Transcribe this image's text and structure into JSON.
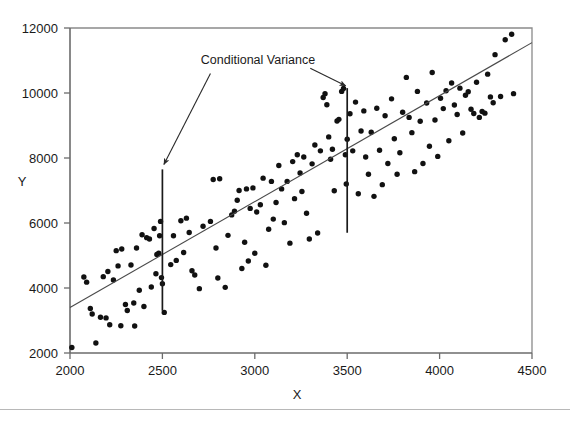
{
  "chart_data": {
    "type": "scatter",
    "title": "",
    "xlabel": "X",
    "ylabel": "Y",
    "xlim": [
      2000,
      4500
    ],
    "ylim": [
      2000,
      12000
    ],
    "xticks": [
      2000,
      2500,
      3000,
      3500,
      4000,
      4500
    ],
    "yticks": [
      2000,
      4000,
      6000,
      8000,
      10000,
      12000
    ],
    "xtick_labels": [
      "2000",
      "2500",
      "3000",
      "3500",
      "4000",
      "4500"
    ],
    "ytick_labels": [
      "2000",
      "4000",
      "6000",
      "8000",
      "10000",
      "12000"
    ],
    "grid": false,
    "legend": null,
    "series": [
      {
        "name": "observations",
        "marker": "filled-circle",
        "color": "#111111",
        "points": [
          [
            2010,
            2170
          ],
          [
            2075,
            4340
          ],
          [
            2090,
            4180
          ],
          [
            2110,
            3370
          ],
          [
            2120,
            3200
          ],
          [
            2140,
            2310
          ],
          [
            2165,
            3100
          ],
          [
            2180,
            4350
          ],
          [
            2195,
            3080
          ],
          [
            2205,
            4510
          ],
          [
            2215,
            2870
          ],
          [
            2235,
            4250
          ],
          [
            2250,
            5150
          ],
          [
            2260,
            4680
          ],
          [
            2275,
            2840
          ],
          [
            2280,
            5200
          ],
          [
            2300,
            3490
          ],
          [
            2310,
            3310
          ],
          [
            2330,
            4710
          ],
          [
            2345,
            3540
          ],
          [
            2350,
            2830
          ],
          [
            2360,
            5230
          ],
          [
            2375,
            3930
          ],
          [
            2390,
            5640
          ],
          [
            2400,
            3430
          ],
          [
            2415,
            5550
          ],
          [
            2430,
            5510
          ],
          [
            2440,
            4030
          ],
          [
            2455,
            5830
          ],
          [
            2465,
            4440
          ],
          [
            2470,
            5030
          ],
          [
            2480,
            5070
          ],
          [
            2485,
            5610
          ],
          [
            2490,
            6050
          ],
          [
            2495,
            4320
          ],
          [
            2500,
            4130
          ],
          [
            2510,
            3250
          ],
          [
            2545,
            4720
          ],
          [
            2560,
            5610
          ],
          [
            2575,
            4850
          ],
          [
            2600,
            6070
          ],
          [
            2615,
            5090
          ],
          [
            2630,
            6150
          ],
          [
            2645,
            5710
          ],
          [
            2660,
            4530
          ],
          [
            2675,
            4400
          ],
          [
            2700,
            3980
          ],
          [
            2720,
            5900
          ],
          [
            2760,
            6050
          ],
          [
            2775,
            7340
          ],
          [
            2790,
            5230
          ],
          [
            2800,
            4310
          ],
          [
            2810,
            7360
          ],
          [
            2840,
            4020
          ],
          [
            2855,
            5620
          ],
          [
            2875,
            6250
          ],
          [
            2890,
            6360
          ],
          [
            2905,
            6700
          ],
          [
            2915,
            7000
          ],
          [
            2930,
            4600
          ],
          [
            2945,
            5410
          ],
          [
            2955,
            7050
          ],
          [
            2965,
            4830
          ],
          [
            2975,
            6450
          ],
          [
            2990,
            7080
          ],
          [
            3000,
            5070
          ],
          [
            3010,
            6340
          ],
          [
            3030,
            6560
          ],
          [
            3045,
            7380
          ],
          [
            3060,
            4700
          ],
          [
            3075,
            5810
          ],
          [
            3090,
            7280
          ],
          [
            3100,
            6120
          ],
          [
            3115,
            6630
          ],
          [
            3130,
            7770
          ],
          [
            3145,
            7050
          ],
          [
            3160,
            6010
          ],
          [
            3175,
            7280
          ],
          [
            3190,
            5380
          ],
          [
            3205,
            7890
          ],
          [
            3215,
            6750
          ],
          [
            3230,
            8100
          ],
          [
            3245,
            7540
          ],
          [
            3255,
            6970
          ],
          [
            3265,
            8030
          ],
          [
            3280,
            6300
          ],
          [
            3295,
            5510
          ],
          [
            3310,
            7820
          ],
          [
            3325,
            8400
          ],
          [
            3340,
            5690
          ],
          [
            3355,
            8220
          ],
          [
            3370,
            9860
          ],
          [
            3380,
            9980
          ],
          [
            3390,
            9640
          ],
          [
            3400,
            8650
          ],
          [
            3410,
            7960
          ],
          [
            3420,
            8270
          ],
          [
            3430,
            6990
          ],
          [
            3445,
            9140
          ],
          [
            3455,
            9190
          ],
          [
            3470,
            10050
          ],
          [
            3480,
            10140
          ],
          [
            3490,
            8100
          ],
          [
            3495,
            7200
          ],
          [
            3500,
            8580
          ],
          [
            3515,
            9360
          ],
          [
            3530,
            8220
          ],
          [
            3545,
            9720
          ],
          [
            3560,
            6900
          ],
          [
            3575,
            8830
          ],
          [
            3590,
            9450
          ],
          [
            3600,
            8030
          ],
          [
            3615,
            7500
          ],
          [
            3630,
            8790
          ],
          [
            3645,
            6820
          ],
          [
            3660,
            9530
          ],
          [
            3675,
            8240
          ],
          [
            3690,
            7180
          ],
          [
            3705,
            9300
          ],
          [
            3720,
            7830
          ],
          [
            3740,
            9820
          ],
          [
            3755,
            8590
          ],
          [
            3770,
            7500
          ],
          [
            3785,
            8160
          ],
          [
            3800,
            9410
          ],
          [
            3820,
            10480
          ],
          [
            3835,
            9250
          ],
          [
            3850,
            8780
          ],
          [
            3865,
            7580
          ],
          [
            3880,
            10050
          ],
          [
            3895,
            9130
          ],
          [
            3910,
            7830
          ],
          [
            3930,
            9690
          ],
          [
            3945,
            8360
          ],
          [
            3960,
            10630
          ],
          [
            3975,
            9170
          ],
          [
            3990,
            8050
          ],
          [
            4005,
            9840
          ],
          [
            4020,
            9520
          ],
          [
            4035,
            10070
          ],
          [
            4050,
            8530
          ],
          [
            4065,
            10310
          ],
          [
            4080,
            9630
          ],
          [
            4095,
            9340
          ],
          [
            4110,
            10150
          ],
          [
            4125,
            8770
          ],
          [
            4140,
            9930
          ],
          [
            4155,
            10040
          ],
          [
            4170,
            9500
          ],
          [
            4185,
            9370
          ],
          [
            4200,
            10330
          ],
          [
            4215,
            9250
          ],
          [
            4230,
            9430
          ],
          [
            4245,
            9380
          ],
          [
            4260,
            10580
          ],
          [
            4275,
            9880
          ],
          [
            4290,
            9700
          ],
          [
            4300,
            11180
          ],
          [
            4330,
            9890
          ],
          [
            4355,
            11640
          ],
          [
            4390,
            11810
          ],
          [
            4400,
            9980
          ]
        ]
      }
    ],
    "regression_line": {
      "name": "regression-line",
      "x_start": 2000,
      "y_start": 3400,
      "x_end": 4500,
      "y_end": 11550,
      "color": "#4a4a4a"
    },
    "conditional_variance_bars": [
      {
        "name": "bar-at-2500",
        "x": 2500,
        "y_low": 3300,
        "y_high": 7650
      },
      {
        "name": "bar-at-3500",
        "x": 3500,
        "y_low": 5700,
        "y_high": 10150
      }
    ],
    "annotations": [
      {
        "text": "Conditional Variance",
        "x": 2930,
        "y": 10900
      }
    ],
    "arrows": [
      {
        "name": "arrow-to-left-bar",
        "from_x": 2760,
        "from_y": 10600,
        "to_x": 2508,
        "to_y": 7800
      },
      {
        "name": "arrow-to-right-bar",
        "from_x": 3300,
        "from_y": 10760,
        "to_x": 3492,
        "to_y": 10220
      }
    ]
  }
}
